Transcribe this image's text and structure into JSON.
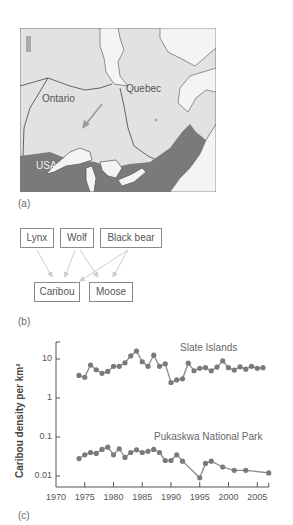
{
  "panels": {
    "a": "(a)",
    "b": "(b)",
    "c": "(c)"
  },
  "map": {
    "labels": {
      "ontario": "Ontario",
      "quebec": "Quebec",
      "usa": "USA"
    },
    "colors": {
      "canada": "#e2e2e2",
      "usa": "#7a7a7a",
      "water": "#f4f4f4",
      "border": "#555555",
      "arrow": "#999999"
    }
  },
  "food_web": {
    "predators": [
      "Lynx",
      "Wolf",
      "Black bear"
    ],
    "prey": [
      "Caribou",
      "Moose"
    ],
    "links": [
      [
        "Lynx",
        "Caribou"
      ],
      [
        "Wolf",
        "Caribou"
      ],
      [
        "Wolf",
        "Moose"
      ],
      [
        "Black bear",
        "Caribou"
      ],
      [
        "Black bear",
        "Moose"
      ]
    ]
  },
  "chart_data": {
    "type": "line",
    "title": "",
    "xlabel": "",
    "ylabel": "Caribou density per km²",
    "yscale": "log",
    "ylim": [
      0.007,
      25
    ],
    "xlim": [
      1970,
      2007
    ],
    "x_ticks": [
      "1970",
      "1975",
      "1980",
      "1985",
      "1990",
      "1995",
      "2000",
      "2005"
    ],
    "y_ticks": [
      "10",
      "1",
      "0.1",
      "0.01"
    ],
    "grid": false,
    "series": [
      {
        "name": "Slate Islands",
        "x": [
          1974,
          1975,
          1976,
          1977,
          1978,
          1979,
          1980,
          1981,
          1982,
          1983,
          1984,
          1985,
          1986,
          1987,
          1988,
          1989,
          1990,
          1991,
          1992,
          1993,
          1994,
          1995,
          1996,
          1997,
          1998,
          1999,
          2000,
          2001,
          2002,
          2003,
          2004,
          2005,
          2006
        ],
        "values": [
          3.8,
          3.4,
          7.0,
          5.3,
          4.3,
          4.8,
          6.5,
          6.5,
          8.0,
          12.0,
          16.0,
          8.5,
          6.5,
          12.5,
          6.5,
          7.5,
          2.5,
          2.9,
          3.1,
          7.8,
          5.0,
          5.8,
          6.0,
          5.0,
          6.2,
          9.0,
          6.0,
          5.2,
          6.3,
          5.5,
          6.5,
          5.8,
          6.0
        ]
      },
      {
        "name": "Pukaskwa National Park",
        "x": [
          1974,
          1975,
          1976,
          1977,
          1978,
          1979,
          1980,
          1981,
          1982,
          1983,
          1984,
          1985,
          1986,
          1987,
          1988,
          1989,
          1990,
          1991,
          1992,
          1995,
          1996,
          1997,
          1999,
          2001,
          2003,
          2007
        ],
        "values": [
          0.028,
          0.035,
          0.04,
          0.038,
          0.048,
          0.055,
          0.035,
          0.05,
          0.03,
          0.04,
          0.047,
          0.04,
          0.043,
          0.048,
          0.04,
          0.025,
          0.025,
          0.035,
          0.024,
          0.009,
          0.021,
          0.024,
          0.017,
          0.014,
          0.014,
          0.012
        ]
      }
    ],
    "annotations": [
      "Slate Islands",
      "Pukaskwa National Park"
    ]
  }
}
